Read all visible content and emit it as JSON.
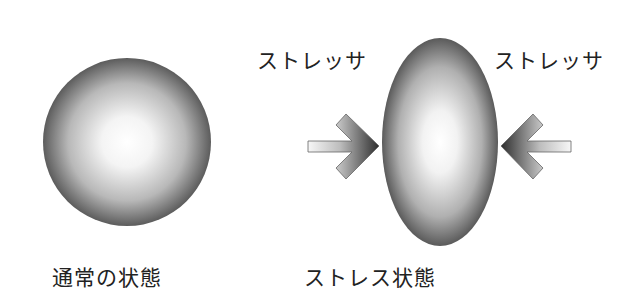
{
  "diagram": {
    "normal": {
      "label": "通常の状態",
      "shape": "circle"
    },
    "stress": {
      "label": "ストレス状態",
      "shape": "ellipse",
      "stressor_left": "ストレッサ",
      "stressor_right": "ストレッサ"
    },
    "colors": {
      "shape_center": "#ffffff",
      "shape_edge": "#5a5a5a",
      "arrow_tip": "#333333",
      "arrow_tail": "#f4f4f4",
      "text": "#222222"
    }
  }
}
